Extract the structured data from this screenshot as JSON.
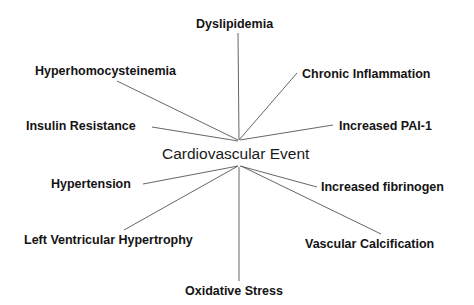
{
  "diagram": {
    "center": {
      "label": "Cardiovascular Event"
    },
    "factors": [
      {
        "id": "dyslipidemia",
        "label": "Dyslipidemia"
      },
      {
        "id": "hyperhomocysteinemia",
        "label": "Hyperhomocysteinemia"
      },
      {
        "id": "chronic-inflammation",
        "label": "Chronic Inflammation"
      },
      {
        "id": "insulin-resistance",
        "label": "Insulin Resistance"
      },
      {
        "id": "increased-pai-1",
        "label": "Increased PAI-1"
      },
      {
        "id": "hypertension",
        "label": "Hypertension"
      },
      {
        "id": "increased-fibrinogen",
        "label": "Increased fibrinogen"
      },
      {
        "id": "left-ventricular-hypertrophy",
        "label": "Left Ventricular Hypertrophy"
      },
      {
        "id": "vascular-calcification",
        "label": "Vascular Calcification"
      },
      {
        "id": "oxidative-stress",
        "label": "Oxidative Stress"
      }
    ],
    "line_color": "#555555"
  }
}
